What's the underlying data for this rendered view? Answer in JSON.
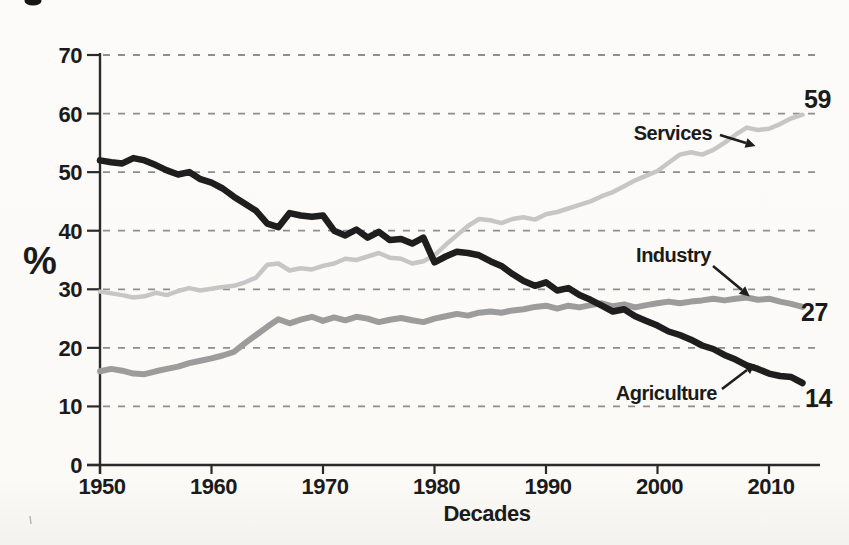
{
  "chart_data": {
    "type": "line",
    "title": "",
    "xlabel": "Decades",
    "ylabel": "%",
    "x_ticks": [
      1950,
      1960,
      1970,
      1980,
      1990,
      2000,
      2010
    ],
    "y_ticks": [
      0,
      10,
      20,
      30,
      40,
      50,
      60,
      70
    ],
    "xlim": [
      1950,
      2013
    ],
    "ylim": [
      0,
      70
    ],
    "grid": "horizontal-dashed",
    "legend_position": "inline-annotations",
    "years_start": 1950,
    "years_end": 2013,
    "axis_color": "#2a2a2a",
    "gridline_color": "#8e8e8e",
    "series": [
      {
        "name": "Services",
        "color": "#c6c6c6",
        "end_label": "59",
        "values": [
          29.6,
          29.3,
          29.0,
          28.6,
          28.8,
          29.4,
          29.0,
          29.7,
          30.2,
          29.8,
          30.1,
          30.4,
          30.6,
          31.2,
          32.0,
          34.2,
          34.4,
          33.2,
          33.6,
          33.4,
          34.0,
          34.4,
          35.2,
          35.0,
          35.6,
          36.2,
          35.4,
          35.2,
          34.4,
          34.8,
          35.8,
          37.6,
          39.2,
          40.8,
          42.0,
          41.8,
          41.3,
          42.0,
          42.3,
          41.9,
          42.8,
          43.2,
          43.8,
          44.4,
          45.0,
          45.9,
          46.6,
          47.6,
          48.6,
          49.4,
          50.2,
          51.6,
          53.0,
          53.4,
          53.0,
          53.8,
          55.0,
          56.4,
          57.6,
          57.2,
          57.4,
          58.2,
          59.2,
          59.8
        ]
      },
      {
        "name": "Industry",
        "color": "#9c9c9c",
        "end_label": "27",
        "values": [
          16.0,
          16.4,
          16.1,
          15.6,
          15.5,
          16.0,
          16.4,
          16.8,
          17.4,
          17.8,
          18.2,
          18.7,
          19.3,
          20.8,
          22.2,
          23.6,
          24.9,
          24.2,
          24.8,
          25.3,
          24.6,
          25.2,
          24.7,
          25.3,
          25.0,
          24.4,
          24.8,
          25.1,
          24.7,
          24.4,
          25.0,
          25.4,
          25.8,
          25.5,
          26.0,
          26.2,
          26.0,
          26.4,
          26.6,
          27.0,
          27.2,
          26.7,
          27.2,
          26.9,
          27.3,
          27.6,
          27.1,
          27.4,
          26.9,
          27.3,
          27.6,
          27.9,
          27.6,
          27.9,
          28.1,
          28.4,
          28.1,
          28.4,
          28.6,
          28.2,
          28.4,
          27.9,
          27.5,
          27.0
        ]
      },
      {
        "name": "Agriculture",
        "color": "#1e1e1e",
        "end_label": "14",
        "values": [
          52.0,
          51.7,
          51.5,
          52.4,
          52.0,
          51.2,
          50.3,
          49.6,
          50.0,
          48.8,
          48.2,
          47.2,
          45.8,
          44.6,
          43.4,
          41.2,
          40.6,
          43.0,
          42.6,
          42.4,
          42.6,
          40.0,
          39.2,
          40.2,
          38.8,
          39.8,
          38.4,
          38.6,
          37.8,
          38.8,
          34.6,
          35.6,
          36.4,
          36.2,
          35.8,
          34.8,
          34.0,
          32.6,
          31.4,
          30.6,
          31.2,
          29.8,
          30.2,
          29.0,
          28.2,
          27.2,
          26.2,
          26.6,
          25.4,
          24.6,
          23.8,
          22.8,
          22.2,
          21.4,
          20.4,
          19.8,
          18.8,
          18.0,
          17.0,
          16.4,
          15.6,
          15.2,
          15.0,
          14.0
        ]
      }
    ],
    "annotations": [
      {
        "label": "Services",
        "series": "Services"
      },
      {
        "label": "Industry",
        "series": "Industry"
      },
      {
        "label": "Agriculture",
        "series": "Agriculture"
      }
    ]
  }
}
